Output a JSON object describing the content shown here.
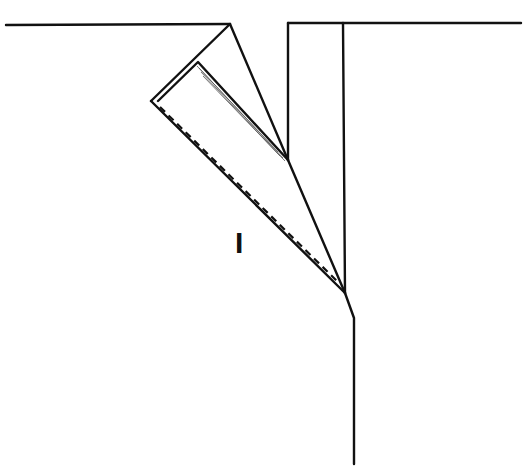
{
  "diagram": {
    "type": "technical line drawing (folded pleat / lapel construction)",
    "label": "I",
    "colors": {
      "line": "#111111",
      "background": "#ffffff"
    },
    "parts": [
      "top-edge-left",
      "top-edge-right",
      "folded-flap",
      "inner-fold-with-shading",
      "dashed-stitch-line",
      "vertical-panel-edge",
      "center-front-line",
      "lower-seam-line"
    ]
  }
}
